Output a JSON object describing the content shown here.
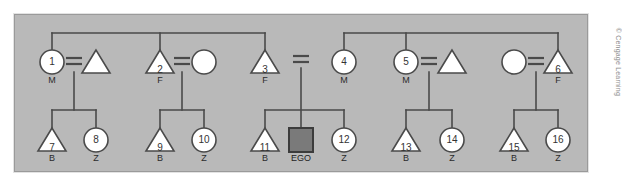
{
  "figure": {
    "kind": "kinship-diagram",
    "credit": "© Cengage Learning",
    "ego_label": "EGO",
    "marriage_symbol": "=",
    "panel_color": "#b9b9b9",
    "line_color": "#4a4a4a",
    "symbol_fill": "#ffffff",
    "ego_fill": "#7a7a7a"
  },
  "generation_upper": {
    "name": "parental-generation",
    "nodes": [
      {
        "id": "g1",
        "number": "1",
        "shape": "circle",
        "kin": "M",
        "numbered": true,
        "x": 52,
        "y": 62
      },
      {
        "id": "g2",
        "number": "",
        "shape": "triangle",
        "kin": "",
        "numbered": false,
        "x": 96,
        "y": 62
      },
      {
        "id": "g3",
        "number": "2",
        "shape": "triangle",
        "kin": "F",
        "numbered": true,
        "x": 160,
        "y": 62
      },
      {
        "id": "g4",
        "number": "",
        "shape": "circle",
        "kin": "",
        "numbered": false,
        "x": 204,
        "y": 62
      },
      {
        "id": "g5",
        "number": "3",
        "shape": "triangle",
        "kin": "F",
        "numbered": true,
        "x": 265,
        "y": 62
      },
      {
        "id": "g6",
        "number": "4",
        "shape": "circle",
        "kin": "M",
        "numbered": true,
        "x": 344,
        "y": 62
      },
      {
        "id": "g7",
        "number": "5",
        "shape": "circle",
        "kin": "M",
        "numbered": true,
        "x": 406,
        "y": 62
      },
      {
        "id": "g8",
        "number": "",
        "shape": "triangle",
        "kin": "",
        "numbered": false,
        "x": 452,
        "y": 62
      },
      {
        "id": "g9",
        "number": "",
        "shape": "circle",
        "kin": "",
        "numbered": false,
        "x": 514,
        "y": 62
      },
      {
        "id": "g10",
        "number": "6",
        "shape": "triangle",
        "kin": "F",
        "numbered": true,
        "x": 558,
        "y": 62
      }
    ],
    "marriages": [
      {
        "id": "m1",
        "x": 74,
        "y": 62,
        "between": [
          "g1",
          "g2"
        ]
      },
      {
        "id": "m2",
        "x": 182,
        "y": 62,
        "between": [
          "g3",
          "g4"
        ]
      },
      {
        "id": "m3",
        "x": 301,
        "y": 60,
        "between": [
          "g5",
          "g6"
        ]
      },
      {
        "id": "m4",
        "x": 429,
        "y": 62,
        "between": [
          "g7",
          "g8"
        ]
      },
      {
        "id": "m5",
        "x": 536,
        "y": 62,
        "between": [
          "g9",
          "g10"
        ]
      }
    ],
    "sibling_bars": [
      {
        "id": "sb-left",
        "y": 33,
        "x1": 52,
        "x2": 265
      },
      {
        "id": "sb-right",
        "y": 33,
        "x1": 344,
        "x2": 558
      }
    ],
    "sibling_bar_stems": [
      {
        "id": "stem-1",
        "x": 52,
        "y1": 33,
        "y2": 50
      },
      {
        "id": "stem-2",
        "x": 160,
        "y1": 33,
        "y2": 50
      },
      {
        "id": "stem-3",
        "x": 265,
        "y1": 33,
        "y2": 50
      },
      {
        "id": "stem-4",
        "x": 344,
        "y1": 33,
        "y2": 50
      },
      {
        "id": "stem-5",
        "x": 406,
        "y1": 33,
        "y2": 50
      },
      {
        "id": "stem-6",
        "x": 558,
        "y1": 33,
        "y2": 50
      }
    ]
  },
  "generation_lower": {
    "name": "ego-generation",
    "nodes": [
      {
        "id": "c7",
        "number": "7",
        "shape": "triangle",
        "kin": "B",
        "x": 52,
        "y": 140
      },
      {
        "id": "c8",
        "number": "8",
        "shape": "circle",
        "kin": "Z",
        "x": 96,
        "y": 140
      },
      {
        "id": "c9",
        "number": "9",
        "shape": "triangle",
        "kin": "B",
        "x": 160,
        "y": 140
      },
      {
        "id": "c10",
        "number": "10",
        "shape": "circle",
        "kin": "Z",
        "x": 204,
        "y": 140
      },
      {
        "id": "c11",
        "number": "11",
        "shape": "triangle",
        "kin": "B",
        "x": 265,
        "y": 140
      },
      {
        "id": "ego",
        "number": "",
        "shape": "square",
        "kin": "EGO",
        "x": 301,
        "y": 140
      },
      {
        "id": "c12",
        "number": "12",
        "shape": "circle",
        "kin": "Z",
        "x": 344,
        "y": 140
      },
      {
        "id": "c13",
        "number": "13",
        "shape": "triangle",
        "kin": "B",
        "x": 406,
        "y": 140
      },
      {
        "id": "c14",
        "number": "14",
        "shape": "circle",
        "kin": "Z",
        "x": 452,
        "y": 140
      },
      {
        "id": "c15",
        "number": "15",
        "shape": "triangle",
        "kin": "B",
        "x": 514,
        "y": 140
      },
      {
        "id": "c16",
        "number": "16",
        "shape": "circle",
        "kin": "Z",
        "x": 558,
        "y": 140
      }
    ],
    "descent_lines": [
      {
        "id": "d1",
        "x": 74,
        "y1": 72,
        "y2": 110
      },
      {
        "id": "d2",
        "x": 182,
        "y1": 72,
        "y2": 110
      },
      {
        "id": "d3",
        "x": 301,
        "y1": 68,
        "y2": 128
      },
      {
        "id": "d4",
        "x": 429,
        "y1": 72,
        "y2": 110
      },
      {
        "id": "d5",
        "x": 536,
        "y1": 72,
        "y2": 110
      }
    ],
    "offspring_bars": [
      {
        "id": "ob1",
        "y": 110,
        "x1": 52,
        "x2": 96
      },
      {
        "id": "ob2",
        "y": 110,
        "x1": 160,
        "x2": 204
      },
      {
        "id": "ob3",
        "y": 110,
        "x1": 265,
        "x2": 344
      },
      {
        "id": "ob4",
        "y": 110,
        "x1": 406,
        "x2": 452
      },
      {
        "id": "ob5",
        "y": 110,
        "x1": 514,
        "x2": 558
      }
    ],
    "offspring_stems": [
      {
        "id": "os-7",
        "x": 52,
        "y1": 110,
        "y2": 128
      },
      {
        "id": "os-8",
        "x": 96,
        "y1": 110,
        "y2": 128
      },
      {
        "id": "os-9",
        "x": 160,
        "y1": 110,
        "y2": 128
      },
      {
        "id": "os-10",
        "x": 204,
        "y1": 110,
        "y2": 128
      },
      {
        "id": "os-11",
        "x": 265,
        "y1": 110,
        "y2": 128
      },
      {
        "id": "os-12",
        "x": 344,
        "y1": 110,
        "y2": 128
      },
      {
        "id": "os-13",
        "x": 406,
        "y1": 110,
        "y2": 128
      },
      {
        "id": "os-14",
        "x": 452,
        "y1": 110,
        "y2": 128
      },
      {
        "id": "os-15",
        "x": 514,
        "y1": 110,
        "y2": 128
      },
      {
        "id": "os-16",
        "x": 558,
        "y1": 110,
        "y2": 128
      }
    ]
  }
}
